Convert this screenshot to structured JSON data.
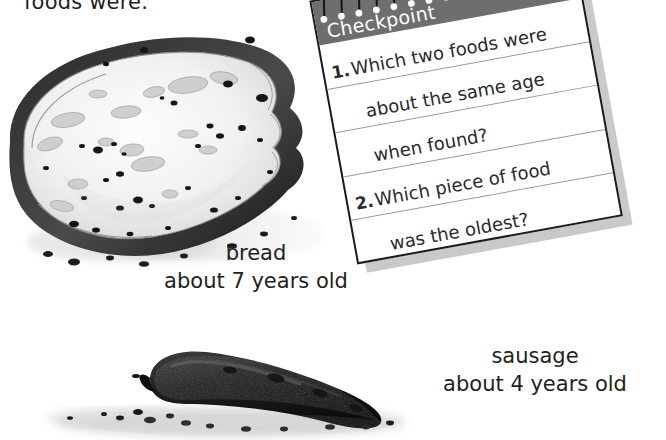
{
  "page": {
    "background": "#ffffff",
    "width": 666,
    "height": 440
  },
  "body_text": {
    "partial_sentence": "foods were."
  },
  "illustrations": [
    {
      "id": "bread",
      "name": "bread-illustration",
      "alt_label": "moldy slice of bread drawing"
    },
    {
      "id": "sausage",
      "name": "sausage-illustration",
      "alt_label": "dark dried sausage drawing"
    }
  ],
  "captions": {
    "bread": {
      "name": "bread",
      "age": "about 7 years old"
    },
    "sausage": {
      "name": "sausage",
      "age": "about 4 years old"
    }
  },
  "checkpoint": {
    "title": "Checkpoint",
    "title_color": "#ffffff",
    "header_color": "#6e6e6e",
    "rule_color": "#9a9a9a",
    "border_color": "#1b1b1b",
    "shadow_color": "#c9c9c9",
    "spiral_count": 15,
    "lines": [
      {
        "number": "1.",
        "text": "Which two foods were"
      },
      {
        "number": "",
        "text": "about the same age"
      },
      {
        "number": "",
        "text": "when found?"
      },
      {
        "number": "2.",
        "text": "Which piece of food"
      },
      {
        "number": "",
        "text": "was the oldest?"
      }
    ],
    "questions": [
      "1. Which two foods were about the same age when found?",
      "2. Which piece of food was the oldest?"
    ]
  }
}
